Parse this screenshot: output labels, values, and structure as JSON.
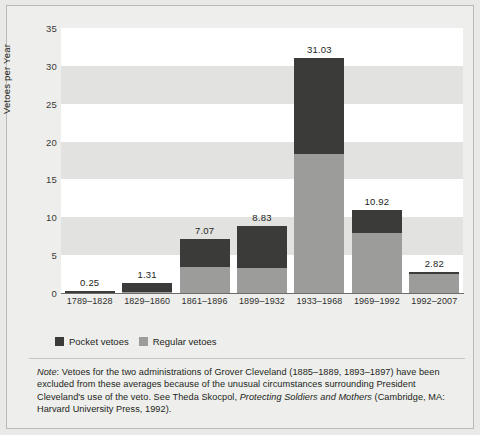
{
  "chart_data": {
    "type": "bar",
    "subtype": "stacked-bar",
    "title": "",
    "xlabel": "",
    "ylabel": "Vetoes per Year",
    "ylim": [
      0,
      35
    ],
    "yticks": [
      0,
      5,
      10,
      15,
      20,
      25,
      30,
      35
    ],
    "grid": "horizontal-banding",
    "legend_position": "below-plot-left",
    "categories": [
      "1789–1828",
      "1829–1860",
      "1861–1896",
      "1899–1932",
      "1933–1968",
      "1969–1992",
      "1992–2007"
    ],
    "totals": [
      0.25,
      1.31,
      7.07,
      8.83,
      31.03,
      10.92,
      2.82
    ],
    "total_labels": [
      "0.25",
      "1.31",
      "7.07",
      "8.83",
      "31.03",
      "10.92",
      "2.82"
    ],
    "series": [
      {
        "name": "Regular vetoes",
        "color": "#9c9c9a",
        "values": [
          0.05,
          0.16,
          3.4,
          3.3,
          18.4,
          7.95,
          2.55
        ]
      },
      {
        "name": "Pocket vetoes",
        "color": "#3b3b39",
        "values": [
          0.2,
          1.15,
          3.67,
          5.53,
          12.63,
          2.97,
          0.27
        ]
      }
    ]
  },
  "legend": {
    "items": [
      {
        "label": "Pocket vetoes",
        "swatch": "pocket-vetoes-swatch"
      },
      {
        "label": "Regular vetoes",
        "swatch": "regular-vetoes-swatch"
      }
    ]
  },
  "note": {
    "lead": "Note",
    "separator": ": ",
    "part1": "Vetoes for the two administrations of Grover Cleveland (1885–1889, 1893–1897) have been excluded from these averages because of the unusual circumstances surrounding President Cleveland's use of the veto. See Theda Skocpol, ",
    "italic_title": "Protecting Soldiers and Mothers",
    "part2": " (Cambridge, MA: Harvard University Press, 1992)."
  },
  "colors": {
    "pocket": "#3b3b39",
    "regular": "#9c9c9a",
    "band": "#e2e2e0",
    "plot_bg": "#ffffff",
    "page_bg": "#eeeeec"
  }
}
